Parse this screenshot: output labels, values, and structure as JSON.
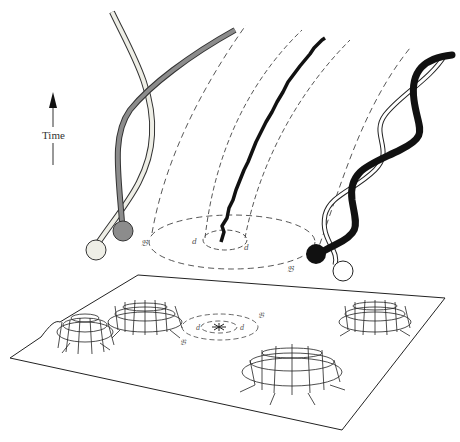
{
  "diagram": {
    "type": "spacetime illustration",
    "axis": {
      "label": "Time",
      "direction": "up"
    },
    "labels": {
      "inner_region": "d",
      "outer_region": "𝔅",
      "inner_region_left": "d",
      "inner_region_right": "d",
      "outer_region_left": "𝔅",
      "outer_region_right": "𝔅",
      "slice_inner_left": "d",
      "slice_inner_right": "d",
      "slice_outer_left": "𝔅",
      "slice_outer_right": "𝔅"
    },
    "elements": [
      {
        "name": "light-worldline",
        "color": "#e8e8e0"
      },
      {
        "name": "gray-worldline",
        "color": "#8a8a8a"
      },
      {
        "name": "black-worldline",
        "color": "#111111"
      },
      {
        "name": "hollow-worldline",
        "color": "#ffffff"
      },
      {
        "name": "jagged-worldline",
        "color": "#111111"
      },
      {
        "name": "spatial-slice-with-wells",
        "wells": 4
      }
    ]
  }
}
